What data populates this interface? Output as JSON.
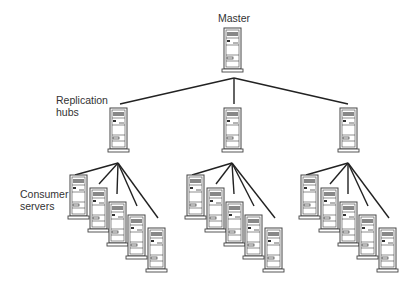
{
  "diagram": {
    "type": "replication-topology",
    "labels": {
      "master": "Master",
      "hubs_line1": "Replication",
      "hubs_line2": "hubs",
      "consumers_line1": "Consumer",
      "consumers_line2": "servers"
    },
    "colors": {
      "line": "#222222",
      "server_fill": "#ffffff",
      "server_stroke": "#444444",
      "panel": "#888888"
    },
    "master": {
      "x": 224,
      "y": 28
    },
    "hubs": [
      {
        "x": 110,
        "y": 108
      },
      {
        "x": 224,
        "y": 108
      },
      {
        "x": 340,
        "y": 108
      }
    ],
    "consumer_offsets": [
      [
        0,
        0
      ],
      [
        20,
        13
      ],
      [
        39,
        27
      ],
      [
        58,
        40
      ],
      [
        78,
        53
      ]
    ],
    "consumer_group_origins": [
      {
        "x": 70,
        "y": 175
      },
      {
        "x": 187,
        "y": 175
      },
      {
        "x": 301,
        "y": 175
      }
    ]
  }
}
